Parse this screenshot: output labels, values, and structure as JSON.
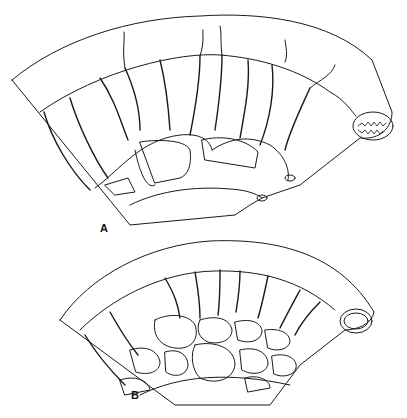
{
  "figure": {
    "panels": [
      {
        "label": "A",
        "description": "Fan-shaped intestinal segment with mesenteric vessels forming few large arcades"
      },
      {
        "label": "B",
        "description": "Fan-shaped intestinal segment with mesenteric vessels forming many small arcades"
      }
    ],
    "colors": {
      "line": "#1a1a1a",
      "background": "#ffffff"
    }
  }
}
